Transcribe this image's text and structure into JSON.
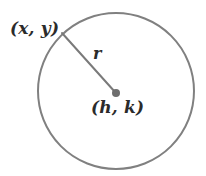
{
  "figure": {
    "background_color": "#ffffff",
    "width": 206,
    "height": 176
  },
  "labels": {
    "point_on_circle": "(x, y)",
    "radius": "r",
    "center": "(h, k)"
  },
  "colors": {
    "circle_stroke": "#808080",
    "radius_stroke": "#7a7a7a",
    "center_dot": "#6e6e6e",
    "text": "#2b2b2b"
  },
  "geometry": {
    "circle": {
      "cx": 116,
      "cy": 91,
      "r": 78,
      "stroke_width": 2
    },
    "center_point": {
      "x": 116,
      "y": 93,
      "dot_radius": 4
    },
    "radius_line": {
      "x1": 62,
      "y1": 33,
      "x2": 115,
      "y2": 92,
      "stroke_width": 2
    }
  },
  "chart_data": {
    "type": "diagram",
    "shape": "circle",
    "annotations": [
      {
        "name": "point_on_circle",
        "text": "(x, y)",
        "x": 62,
        "y": 33
      },
      {
        "name": "radius_segment",
        "text": "r",
        "x": 98,
        "y": 54
      },
      {
        "name": "center",
        "text": "(h, k)",
        "x": 116,
        "y": 93
      }
    ]
  }
}
